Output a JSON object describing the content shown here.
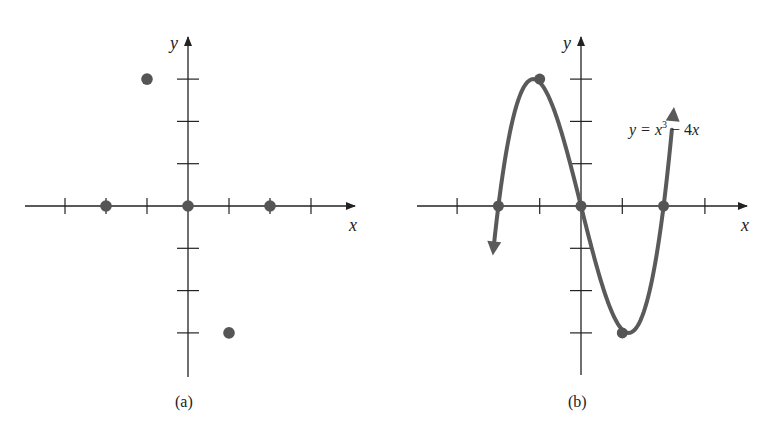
{
  "colors": {
    "axis": "#222222",
    "point": "#555555",
    "curve": "#5a5a5a"
  },
  "chart_data": [
    {
      "type": "scatter",
      "panel_label": "(a)",
      "xlabel": "x",
      "ylabel": "y",
      "xlim": [
        -3.5,
        4
      ],
      "ylim": [
        -4,
        3.5
      ],
      "x_ticks": [
        -3,
        -2,
        -1,
        1,
        2,
        3
      ],
      "y_ticks": [
        -3,
        -2,
        -1,
        1,
        2,
        3
      ],
      "grid": false,
      "points": [
        {
          "x": -2,
          "y": 0
        },
        {
          "x": 0,
          "y": 0
        },
        {
          "x": 2,
          "y": 0
        },
        {
          "x": -1,
          "y": 3
        },
        {
          "x": 1,
          "y": -3
        }
      ]
    },
    {
      "type": "line",
      "panel_label": "(b)",
      "xlabel": "x",
      "ylabel": "y",
      "title": "y = x³ − 4x",
      "equation": {
        "lhs": "y",
        "rhs_a": "x",
        "exp": "3",
        "rhs_b": " − 4x"
      },
      "xlim": [
        -3.5,
        4
      ],
      "ylim": [
        -4,
        3.5
      ],
      "x_ticks": [
        -3,
        -2,
        -1,
        1,
        2,
        3
      ],
      "y_ticks": [
        -3,
        -2,
        -1,
        1,
        2,
        3
      ],
      "grid": false,
      "function": "x^3 - 4x",
      "highlighted_points": [
        {
          "x": -2,
          "y": 0
        },
        {
          "x": 0,
          "y": 0
        },
        {
          "x": 2,
          "y": 0
        },
        {
          "x": -1,
          "y": 3
        },
        {
          "x": 1,
          "y": -3
        }
      ],
      "arrows_at_ends": true
    }
  ]
}
